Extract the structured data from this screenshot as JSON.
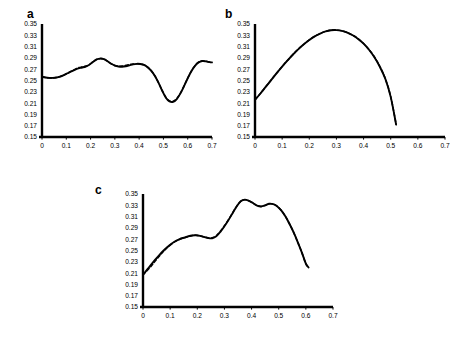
{
  "figure": {
    "background": "#ffffff",
    "line_color": "#000000",
    "axis_color": "#000000"
  },
  "chart_data": [
    {
      "type": "line",
      "panel": "a",
      "title": "a",
      "xlabel": "",
      "ylabel": "",
      "xlim": [
        0,
        0.7
      ],
      "ylim": [
        0.15,
        0.35
      ],
      "xticks": [
        "0",
        "0.1",
        "0.2",
        "0.3",
        "0.4",
        "0.5",
        "0.6",
        "0.7"
      ],
      "xtick_values": [
        0,
        0.1,
        0.2,
        0.3,
        0.4,
        0.5,
        0.6,
        0.7
      ],
      "yticks": [
        "0.15",
        "0.17",
        "0.19",
        "0.21",
        "0.23",
        "0.25",
        "0.27",
        "0.29",
        "0.31",
        "0.33",
        "0.35"
      ],
      "ytick_values": [
        0.15,
        0.17,
        0.19,
        0.21,
        0.23,
        0.25,
        0.27,
        0.29,
        0.31,
        0.33,
        0.35
      ],
      "grid": false,
      "legend": "none",
      "series": [
        {
          "name": "solid",
          "style": "solid",
          "x": [
            0.0,
            0.015,
            0.03,
            0.045,
            0.06,
            0.075,
            0.09,
            0.105,
            0.12,
            0.135,
            0.15,
            0.165,
            0.18,
            0.195,
            0.21,
            0.225,
            0.24,
            0.255,
            0.27,
            0.285,
            0.3,
            0.315,
            0.33,
            0.345,
            0.36,
            0.375,
            0.39,
            0.405,
            0.42,
            0.435,
            0.45,
            0.465,
            0.48,
            0.495,
            0.51,
            0.525,
            0.54,
            0.555,
            0.57,
            0.585,
            0.6,
            0.615,
            0.63,
            0.645,
            0.66,
            0.675,
            0.69,
            0.7
          ],
          "y": [
            0.2565,
            0.2552,
            0.2546,
            0.2546,
            0.2553,
            0.257,
            0.2596,
            0.2628,
            0.266,
            0.269,
            0.2714,
            0.273,
            0.2748,
            0.278,
            0.283,
            0.2872,
            0.2888,
            0.2878,
            0.284,
            0.2796,
            0.2764,
            0.2748,
            0.2744,
            0.2752,
            0.2768,
            0.2786,
            0.2795,
            0.2792,
            0.2776,
            0.2736,
            0.2672,
            0.258,
            0.2458,
            0.2318,
            0.2196,
            0.213,
            0.2122,
            0.2172,
            0.2272,
            0.2402,
            0.254,
            0.2664,
            0.276,
            0.282,
            0.2842,
            0.2838,
            0.2826,
            0.282
          ]
        },
        {
          "name": "dashed",
          "style": "dashed",
          "x": [
            0.0,
            0.015,
            0.03,
            0.045,
            0.06,
            0.075,
            0.09,
            0.105,
            0.12,
            0.135,
            0.15,
            0.165,
            0.18,
            0.195,
            0.21,
            0.225,
            0.24,
            0.255,
            0.27,
            0.285,
            0.3,
            0.315,
            0.33,
            0.345,
            0.36,
            0.375,
            0.39,
            0.405,
            0.42,
            0.435,
            0.45,
            0.465,
            0.48,
            0.495,
            0.51,
            0.525,
            0.54,
            0.555,
            0.57,
            0.585,
            0.6,
            0.615,
            0.63,
            0.645,
            0.66,
            0.675,
            0.69,
            0.7
          ],
          "y": [
            0.2565,
            0.2552,
            0.2546,
            0.2546,
            0.2553,
            0.257,
            0.2596,
            0.2628,
            0.2662,
            0.2696,
            0.2726,
            0.2742,
            0.2752,
            0.2782,
            0.283,
            0.2872,
            0.2888,
            0.2878,
            0.284,
            0.2796,
            0.2766,
            0.2754,
            0.2756,
            0.2768,
            0.2782,
            0.2792,
            0.2798,
            0.2792,
            0.2776,
            0.2736,
            0.2672,
            0.258,
            0.2458,
            0.2322,
            0.2204,
            0.214,
            0.2132,
            0.218,
            0.2278,
            0.2406,
            0.2542,
            0.2666,
            0.2764,
            0.2826,
            0.2848,
            0.2842,
            0.2828,
            0.2822
          ]
        }
      ]
    },
    {
      "type": "line",
      "panel": "b",
      "title": "b",
      "xlabel": "",
      "ylabel": "",
      "xlim": [
        0,
        0.7
      ],
      "ylim": [
        0.15,
        0.35
      ],
      "xticks": [
        "0",
        "0.1",
        "0.2",
        "0.3",
        "0.4",
        "0.5",
        "0.6",
        "0.7"
      ],
      "xtick_values": [
        0,
        0.1,
        0.2,
        0.3,
        0.4,
        0.5,
        0.6,
        0.7
      ],
      "yticks": [
        "0.15",
        "0.17",
        "0.19",
        "0.21",
        "0.23",
        "0.25",
        "0.27",
        "0.29",
        "0.31",
        "0.33",
        "0.35"
      ],
      "ytick_values": [
        0.15,
        0.17,
        0.19,
        0.21,
        0.23,
        0.25,
        0.27,
        0.29,
        0.31,
        0.33,
        0.35
      ],
      "grid": false,
      "legend": "none",
      "series": [
        {
          "name": "solid",
          "style": "solid",
          "x": [
            0.0,
            0.02,
            0.04,
            0.06,
            0.08,
            0.1,
            0.12,
            0.14,
            0.16,
            0.18,
            0.2,
            0.22,
            0.24,
            0.26,
            0.28,
            0.3,
            0.32,
            0.34,
            0.36,
            0.38,
            0.4,
            0.42,
            0.44,
            0.46,
            0.48,
            0.5,
            0.52
          ],
          "y": [
            0.216,
            0.227,
            0.239,
            0.251,
            0.263,
            0.2745,
            0.2855,
            0.296,
            0.3055,
            0.314,
            0.3215,
            0.328,
            0.333,
            0.3368,
            0.339,
            0.3392,
            0.3378,
            0.3348,
            0.33,
            0.3236,
            0.3152,
            0.3044,
            0.291,
            0.2742,
            0.253,
            0.221,
            0.172
          ]
        },
        {
          "name": "dashed",
          "style": "dashed",
          "x": [
            0.0,
            0.02,
            0.04,
            0.06,
            0.08,
            0.1,
            0.12,
            0.14,
            0.16,
            0.18,
            0.2,
            0.22,
            0.24,
            0.26,
            0.28,
            0.3,
            0.32,
            0.34,
            0.36,
            0.38,
            0.4,
            0.42,
            0.44,
            0.46,
            0.48,
            0.5,
            0.52
          ],
          "y": [
            0.216,
            0.2272,
            0.2392,
            0.2512,
            0.2632,
            0.2748,
            0.2858,
            0.2962,
            0.3058,
            0.3142,
            0.3218,
            0.3282,
            0.3332,
            0.337,
            0.3392,
            0.3394,
            0.338,
            0.335,
            0.3302,
            0.3238,
            0.3156,
            0.305,
            0.2916,
            0.2748,
            0.2534,
            0.2214,
            0.1722
          ]
        }
      ]
    },
    {
      "type": "line",
      "panel": "c",
      "title": "c",
      "xlabel": "",
      "ylabel": "",
      "xlim": [
        0,
        0.7
      ],
      "ylim": [
        0.15,
        0.35
      ],
      "xticks": [
        "0",
        "0.1",
        "0.2",
        "0.3",
        "0.4",
        "0.5",
        "0.6",
        "0.7"
      ],
      "xtick_values": [
        0,
        0.1,
        0.2,
        0.3,
        0.4,
        0.5,
        0.6,
        0.7
      ],
      "yticks": [
        "0.15",
        "0.17",
        "0.19",
        "0.21",
        "0.23",
        "0.25",
        "0.27",
        "0.29",
        "0.31",
        "0.33",
        "0.35"
      ],
      "ytick_values": [
        0.15,
        0.17,
        0.19,
        0.21,
        0.23,
        0.25,
        0.27,
        0.29,
        0.31,
        0.33,
        0.35
      ],
      "grid": false,
      "legend": "none",
      "series": [
        {
          "name": "solid",
          "style": "solid",
          "x": [
            0.0,
            0.015,
            0.03,
            0.045,
            0.06,
            0.075,
            0.09,
            0.105,
            0.12,
            0.135,
            0.15,
            0.165,
            0.18,
            0.195,
            0.21,
            0.225,
            0.24,
            0.255,
            0.27,
            0.285,
            0.3,
            0.315,
            0.33,
            0.345,
            0.36,
            0.375,
            0.39,
            0.405,
            0.42,
            0.435,
            0.45,
            0.465,
            0.48,
            0.495,
            0.51,
            0.525,
            0.54,
            0.555,
            0.57,
            0.585,
            0.6,
            0.61
          ],
          "y": [
            0.207,
            0.216,
            0.225,
            0.2338,
            0.242,
            0.2495,
            0.2562,
            0.262,
            0.2668,
            0.2702,
            0.2726,
            0.2748,
            0.2766,
            0.277,
            0.276,
            0.274,
            0.272,
            0.2716,
            0.275,
            0.283,
            0.293,
            0.304,
            0.316,
            0.328,
            0.337,
            0.34,
            0.338,
            0.334,
            0.3296,
            0.328,
            0.33,
            0.3328,
            0.332,
            0.328,
            0.3206,
            0.31,
            0.2968,
            0.282,
            0.265,
            0.2468,
            0.2268,
            0.22
          ]
        },
        {
          "name": "dashed",
          "style": "dashed",
          "x": [
            0.0,
            0.015,
            0.03,
            0.045,
            0.06,
            0.075,
            0.09,
            0.105,
            0.12,
            0.135,
            0.15,
            0.165,
            0.18,
            0.195,
            0.21,
            0.225,
            0.24,
            0.255,
            0.27,
            0.285,
            0.3,
            0.315,
            0.33,
            0.345,
            0.36,
            0.375,
            0.39,
            0.405,
            0.42,
            0.435,
            0.45,
            0.465,
            0.48,
            0.495,
            0.51,
            0.525,
            0.54,
            0.555,
            0.57,
            0.585,
            0.6,
            0.61
          ],
          "y": [
            0.207,
            0.2142,
            0.2222,
            0.2312,
            0.24,
            0.2482,
            0.2552,
            0.2612,
            0.266,
            0.2696,
            0.2722,
            0.2744,
            0.2762,
            0.2768,
            0.276,
            0.2742,
            0.2724,
            0.2724,
            0.2764,
            0.2842,
            0.2938,
            0.3046,
            0.3164,
            0.3282,
            0.337,
            0.34,
            0.338,
            0.334,
            0.3296,
            0.328,
            0.33,
            0.3328,
            0.332,
            0.328,
            0.3206,
            0.31,
            0.2968,
            0.282,
            0.265,
            0.2468,
            0.2268,
            0.22
          ]
        }
      ]
    }
  ]
}
